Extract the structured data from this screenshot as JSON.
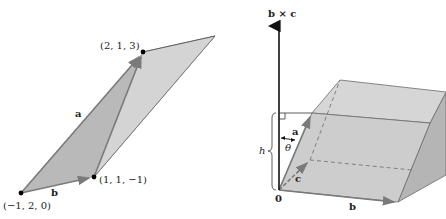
{
  "left_figure": {
    "points": [
      {
        "label": "(−1, 2, 0)",
        "x": 21,
        "y": 193
      },
      {
        "label": "(1, 1, −1)",
        "x": 94,
        "y": 177
      },
      {
        "label": "(2, 1, 3)",
        "x": 143,
        "y": 52
      }
    ],
    "vector_labels": {
      "a": "a",
      "b": "b"
    }
  },
  "right_figure": {
    "axis_label": "b × c",
    "origin_label": "0",
    "vector_labels": {
      "a": "a",
      "b": "b",
      "c": "c"
    },
    "angle_label": "θ",
    "height_label": "h"
  },
  "colors": {
    "face_dark": "#b9b9b9",
    "face_mid": "#cfcfcf",
    "face_light": "#dedede",
    "edge": "#6b6b6b",
    "vector": "#7a7a7a",
    "axis": "#111111",
    "point": "#000000"
  }
}
